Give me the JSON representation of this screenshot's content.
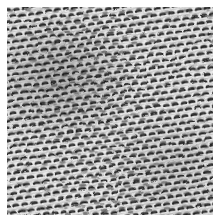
{
  "image": {
    "kind": "texture-photograph",
    "subject": "woven mesh fabric",
    "color_mode": "grayscale",
    "width_px": 216,
    "height_px": 219,
    "margin_px": 7,
    "plate_width_px": 206,
    "plate_height_px": 208,
    "alt_text": "Close-up grayscale photograph of a dense woven mesh textile with repeating horizontally elongated dark knots"
  },
  "texture": {
    "pattern": "plain-weave mesh of elongated dark slubs on a light ground",
    "dominant_orientation_deg": -8,
    "cell_width_px": 9,
    "cell_height_px": 6.5,
    "row_offset_px": 4.5,
    "blob_rx_px": 3.4,
    "blob_ry_px": 1.7,
    "columns": 26,
    "rows": 36,
    "contrast": "high",
    "density": "dense",
    "brightest_region": "upper-right",
    "darkest_region": "upper-left"
  },
  "colors": {
    "paper": "#ffffff",
    "ground_light": "#f2f2f2",
    "ground_mid": "#b9b9b9",
    "thread_dark": "#1c1c1c",
    "thread_mid": "#565656",
    "shadow": "#000000"
  }
}
